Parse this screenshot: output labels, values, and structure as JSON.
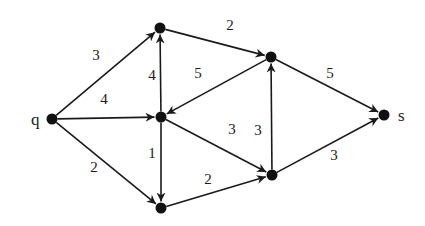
{
  "graph": {
    "title": "",
    "directed": true,
    "nodes": [
      {
        "id": "q",
        "label": "q"
      },
      {
        "id": "a",
        "label": ""
      },
      {
        "id": "b",
        "label": ""
      },
      {
        "id": "c",
        "label": ""
      },
      {
        "id": "d",
        "label": ""
      },
      {
        "id": "e",
        "label": ""
      },
      {
        "id": "s",
        "label": "s"
      }
    ],
    "edges": [
      {
        "from": "q",
        "to": "a",
        "weight": "3"
      },
      {
        "from": "q",
        "to": "b",
        "weight": "4"
      },
      {
        "from": "q",
        "to": "c",
        "weight": "2"
      },
      {
        "from": "b",
        "to": "a",
        "weight": "4"
      },
      {
        "from": "b",
        "to": "c",
        "weight": "1"
      },
      {
        "from": "a",
        "to": "d",
        "weight": "2"
      },
      {
        "from": "d",
        "to": "b",
        "weight": "5"
      },
      {
        "from": "b",
        "to": "e",
        "weight": "3"
      },
      {
        "from": "c",
        "to": "e",
        "weight": "2"
      },
      {
        "from": "e",
        "to": "d",
        "weight": "3"
      },
      {
        "from": "d",
        "to": "s",
        "weight": "5"
      },
      {
        "from": "e",
        "to": "s",
        "weight": "3"
      }
    ]
  }
}
